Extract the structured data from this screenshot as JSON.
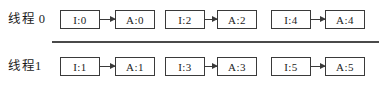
{
  "figure": {
    "rows": [
      {
        "label": "线程 0",
        "pairs": [
          {
            "from": "I:0",
            "to": "A:0"
          },
          {
            "from": "I:2",
            "to": "A:2"
          },
          {
            "from": "I:4",
            "to": "A:4"
          }
        ]
      },
      {
        "label": "线程1",
        "pairs": [
          {
            "from": "I:1",
            "to": "A:1"
          },
          {
            "from": "I:3",
            "to": "A:3"
          },
          {
            "from": "I:5",
            "to": "A:5"
          }
        ]
      }
    ]
  },
  "colors": {
    "border": "#3a3a3a",
    "text": "#1c1c1c",
    "divider": "#4a4a4a",
    "bg": "#ffffff"
  }
}
